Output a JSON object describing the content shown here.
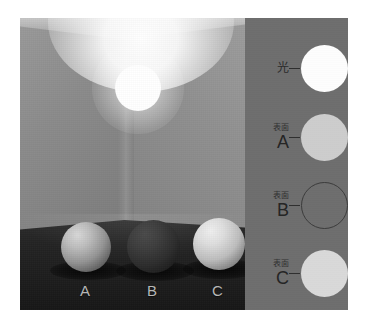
{
  "figure": {
    "type": "lightness-constancy-illustration",
    "scene": {
      "light_source": {
        "name": "ceiling-lamp",
        "color": "#ffffff"
      },
      "room": {
        "left_wall_color": "#8b8b8b",
        "right_wall_color": "#8f8f8f",
        "ceiling_color": "#b6b6b6",
        "floor_color": "#1f1f1f"
      },
      "spheres": [
        {
          "label": "A",
          "surface_color": "#949494",
          "description": "mid-gray sphere"
        },
        {
          "label": "B",
          "surface_color": "#2c2c2c",
          "description": "dark sphere"
        },
        {
          "label": "C",
          "surface_color": "#bdbdbd",
          "description": "light sphere"
        }
      ]
    },
    "legend": {
      "background_color": "#6e6e6e",
      "rows": [
        {
          "id": "light",
          "kanji": "光",
          "letter": "",
          "swatch_color": "#fdfdfd",
          "swatch_style": "filled"
        },
        {
          "id": "surface-a",
          "kanji": "表面",
          "letter": "A",
          "swatch_color": "#cdcdcd",
          "swatch_style": "filled"
        },
        {
          "id": "surface-b",
          "kanji": "表面",
          "letter": "B",
          "swatch_color": "transparent",
          "swatch_style": "outline"
        },
        {
          "id": "surface-c",
          "kanji": "表面",
          "letter": "C",
          "swatch_color": "#d9d9d9",
          "swatch_style": "filled"
        }
      ]
    }
  }
}
